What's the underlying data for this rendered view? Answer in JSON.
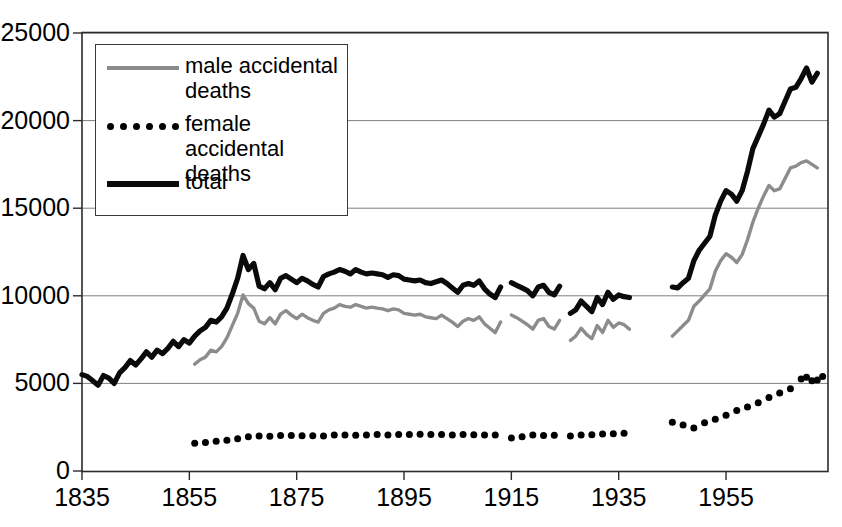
{
  "chart_data": {
    "type": "line",
    "title": "",
    "xlabel": "",
    "ylabel": "",
    "xlim": [
      1835,
      1974
    ],
    "ylim": [
      0,
      25000
    ],
    "grid": true,
    "legend_position": "top-left",
    "y_ticks": [
      0,
      5000,
      10000,
      15000,
      20000,
      25000
    ],
    "y_tick_labels": [
      "0",
      "5000",
      "10000",
      "15000",
      "20000",
      "25000"
    ],
    "x_ticks": [
      1835,
      1855,
      1875,
      1895,
      1915,
      1935,
      1955
    ],
    "x_tick_labels": [
      "1835",
      "1855",
      "1875",
      "1895",
      "1915",
      "1935",
      "1955"
    ],
    "colors": {
      "total": "#0a0a0a",
      "male": "#8c8c8c",
      "female": "#000000",
      "grid": "#808080",
      "axis": "#2b2b2b"
    },
    "series": [
      {
        "name": "male accidental deaths",
        "style": "line",
        "color": "#8c8c8c",
        "segments": [
          {
            "x": [
              1856,
              1857,
              1858,
              1859,
              1860,
              1861,
              1862,
              1863,
              1864,
              1865,
              1866,
              1867,
              1868,
              1869,
              1870,
              1871,
              1872,
              1873,
              1874,
              1875,
              1876,
              1877,
              1878,
              1879,
              1880,
              1881,
              1882,
              1883,
              1884,
              1885,
              1886,
              1887,
              1888,
              1889,
              1890,
              1891,
              1892,
              1893,
              1894,
              1895,
              1896,
              1897,
              1898,
              1899,
              1900,
              1901,
              1902,
              1903,
              1904,
              1905,
              1906,
              1907,
              1908,
              1909,
              1910,
              1911,
              1912,
              1913
            ],
            "y": [
              6100,
              6350,
              6500,
              6900,
              6800,
              7100,
              7600,
              8300,
              9000,
              10050,
              9550,
              9300,
              8550,
              8400,
              8750,
              8400,
              8950,
              9150,
              8900,
              8700,
              8950,
              8750,
              8600,
              8500,
              9000,
              9200,
              9300,
              9500,
              9400,
              9350,
              9500,
              9400,
              9300,
              9350,
              9300,
              9250,
              9150,
              9250,
              9200,
              9000,
              8950,
              8900,
              8950,
              8800,
              8750,
              8700,
              8900,
              8700,
              8500,
              8250,
              8550,
              8700,
              8600,
              8800,
              8400,
              8150,
              7900,
              8500
            ]
          },
          {
            "x": [
              1915,
              1916,
              1917,
              1918,
              1919,
              1920,
              1921,
              1922,
              1923,
              1924
            ],
            "y": [
              8900,
              8750,
              8550,
              8350,
              8100,
              8600,
              8700,
              8250,
              8100,
              8600
            ]
          },
          {
            "x": [
              1926,
              1927,
              1928,
              1929,
              1930,
              1931,
              1932,
              1933,
              1934,
              1935,
              1936,
              1937
            ],
            "y": [
              7450,
              7700,
              8150,
              7800,
              7550,
              8300,
              7900,
              8600,
              8200,
              8450,
              8350,
              8100
            ]
          },
          {
            "x": [
              1945,
              1946,
              1947,
              1948,
              1949,
              1950,
              1951,
              1952,
              1953,
              1954,
              1955,
              1956,
              1957,
              1958,
              1959,
              1960,
              1961,
              1962,
              1963,
              1964,
              1965,
              1966,
              1967,
              1968,
              1969,
              1970,
              1971,
              1972
            ],
            "y": [
              7700,
              8000,
              8300,
              8600,
              9400,
              9700,
              10050,
              10400,
              11400,
              12000,
              12400,
              12200,
              11900,
              12350,
              13200,
              14200,
              15000,
              15700,
              16300,
              16000,
              16100,
              16700,
              17300,
              17400,
              17600,
              17700,
              17500,
              17300
            ]
          }
        ]
      },
      {
        "name": "female accidental deaths",
        "style": "dots",
        "color": "#000000",
        "segments": [
          {
            "x": [
              1856,
              1858,
              1860,
              1862,
              1864,
              1866,
              1868,
              1870,
              1872,
              1874,
              1876,
              1878,
              1880,
              1882,
              1884,
              1886,
              1888,
              1890,
              1892,
              1894,
              1896,
              1898,
              1900,
              1902,
              1904,
              1906,
              1908,
              1910,
              1912
            ],
            "y": [
              1580,
              1620,
              1700,
              1760,
              1840,
              1960,
              2000,
              1990,
              2030,
              2020,
              2010,
              2010,
              2000,
              2060,
              2050,
              2040,
              2060,
              2080,
              2060,
              2080,
              2090,
              2100,
              2080,
              2080,
              2060,
              2080,
              2070,
              2060,
              2050
            ]
          },
          {
            "x": [
              1915,
              1917,
              1919,
              1921,
              1923
            ],
            "y": [
              1880,
              1960,
              2050,
              2020,
              2040
            ]
          },
          {
            "x": [
              1926,
              1928,
              1930,
              1932,
              1934,
              1936
            ],
            "y": [
              2000,
              2050,
              2070,
              2110,
              2130,
              2150
            ]
          },
          {
            "x": [
              1945,
              1947,
              1949,
              1951,
              1953,
              1955,
              1957,
              1959,
              1961,
              1963,
              1965,
              1967,
              1969,
              1970,
              1971,
              1972,
              1973
            ],
            "y": [
              2780,
              2620,
              2450,
              2750,
              2950,
              3180,
              3450,
              3650,
              3900,
              4200,
              4450,
              4700,
              5250,
              5350,
              5150,
              5200,
              5400
            ]
          }
        ]
      },
      {
        "name": "total",
        "style": "line-thick",
        "color": "#0a0a0a",
        "segments": [
          {
            "x": [
              1835,
              1836,
              1837,
              1838,
              1839,
              1840,
              1841,
              1842,
              1843,
              1844,
              1845,
              1846,
              1847,
              1848,
              1849,
              1850,
              1851,
              1852,
              1853,
              1854,
              1855,
              1856,
              1857,
              1858,
              1859,
              1860,
              1861,
              1862,
              1863,
              1864,
              1865,
              1866,
              1867,
              1868,
              1869,
              1870,
              1871,
              1872,
              1873,
              1874,
              1875,
              1876,
              1877,
              1878,
              1879,
              1880,
              1881,
              1882,
              1883,
              1884,
              1885,
              1886,
              1887,
              1888,
              1889,
              1890,
              1891,
              1892,
              1893,
              1894,
              1895,
              1896,
              1897,
              1898,
              1899,
              1900,
              1901,
              1902,
              1903,
              1904,
              1905,
              1906,
              1907,
              1908,
              1909,
              1910,
              1911,
              1912,
              1913
            ],
            "y": [
              5500,
              5400,
              5150,
              4900,
              5450,
              5300,
              5000,
              5600,
              5900,
              6300,
              6050,
              6400,
              6800,
              6500,
              6900,
              6700,
              7000,
              7400,
              7100,
              7500,
              7300,
              7700,
              8000,
              8200,
              8600,
              8500,
              8800,
              9300,
              10100,
              11000,
              12300,
              11500,
              11850,
              10550,
              10400,
              10750,
              10350,
              11000,
              11150,
              10950,
              10750,
              11000,
              10850,
              10650,
              10500,
              11100,
              11250,
              11350,
              11500,
              11400,
              11250,
              11500,
              11350,
              11250,
              11300,
              11250,
              11200,
              11050,
              11200,
              11150,
              10950,
              10900,
              10850,
              10900,
              10750,
              10700,
              10800,
              10900,
              10700,
              10450,
              10200,
              10600,
              10700,
              10600,
              10850,
              10400,
              10100,
              9900,
              10500
            ]
          },
          {
            "x": [
              1915,
              1916,
              1917,
              1918,
              1919,
              1920,
              1921,
              1922,
              1923,
              1924
            ],
            "y": [
              10750,
              10600,
              10450,
              10300,
              10000,
              10500,
              10600,
              10200,
              10050,
              10550
            ]
          },
          {
            "x": [
              1926,
              1927,
              1928,
              1929,
              1930,
              1931,
              1932,
              1933,
              1934,
              1935,
              1936,
              1937
            ],
            "y": [
              9000,
              9200,
              9700,
              9400,
              9100,
              9900,
              9500,
              10200,
              9800,
              10050,
              9950,
              9900
            ]
          },
          {
            "x": [
              1945,
              1946,
              1947,
              1948,
              1949,
              1950,
              1951,
              1952,
              1953,
              1954,
              1955,
              1956,
              1957,
              1958,
              1959,
              1960,
              1961,
              1962,
              1963,
              1964,
              1965,
              1966,
              1967,
              1968,
              1969,
              1970,
              1971,
              1972
            ],
            "y": [
              10500,
              10450,
              10750,
              11000,
              12000,
              12600,
              13000,
              13400,
              14600,
              15400,
              16000,
              15800,
              15400,
              16000,
              17100,
              18400,
              19100,
              19800,
              20600,
              20200,
              20400,
              21100,
              21800,
              21900,
              22400,
              23000,
              22200,
              22700
            ]
          }
        ]
      }
    ]
  },
  "legend": {
    "items": [
      {
        "label": "male accidental\ndeaths",
        "marker": "solid-gray-line"
      },
      {
        "label": "female accidental\ndeaths",
        "marker": "dotted-black"
      },
      {
        "label": "total",
        "marker": "solid-black-thick-line"
      }
    ]
  }
}
